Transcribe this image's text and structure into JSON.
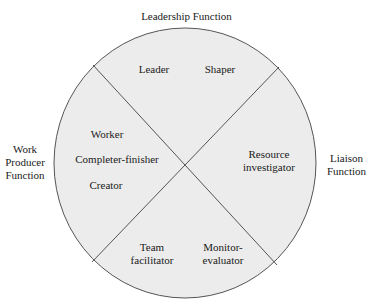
{
  "diagram": {
    "colors": {
      "circle_fill": "#ececec",
      "circle_stroke": "#555555",
      "divider_stroke": "#555555",
      "text": "#1a1a1a"
    },
    "functions": {
      "top": {
        "label": "Leadership Function",
        "roles": [
          "Leader",
          "Shaper"
        ]
      },
      "left": {
        "label_lines": [
          "Work",
          "Producer",
          "Function"
        ],
        "roles": [
          "Worker",
          "Completer-finisher",
          "Creator"
        ]
      },
      "right": {
        "label_lines": [
          "Liaison",
          "Function"
        ],
        "roles": [
          {
            "lines": [
              "Resource",
              "investigator"
            ]
          }
        ]
      },
      "bottom": {
        "roles": [
          {
            "lines": [
              "Team",
              "facilitator"
            ]
          },
          {
            "lines": [
              "Monitor-",
              "evaluator"
            ]
          }
        ]
      }
    }
  }
}
